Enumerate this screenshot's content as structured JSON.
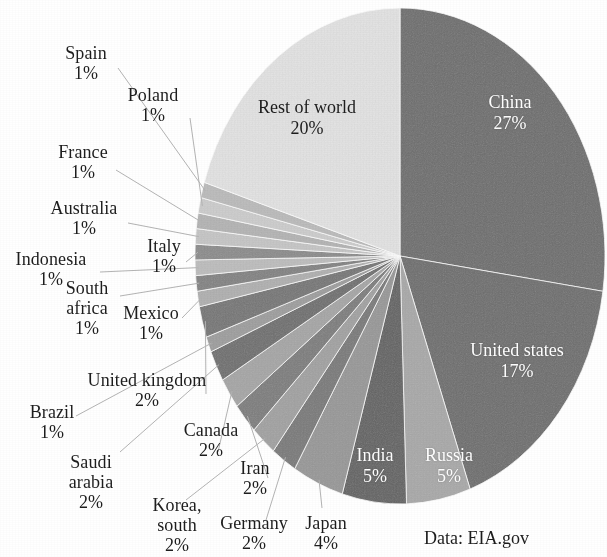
{
  "source_note": "Data: EIA.gov",
  "chart_data": {
    "type": "pie",
    "title": "",
    "subtitle": "",
    "xlabel": "",
    "ylabel": "",
    "legend_position": "none",
    "grid": false,
    "units": "percent",
    "start_angle_deg": 0,
    "direction": "clockwise",
    "annotations": [
      "Data: EIA.gov"
    ],
    "labels": [
      "China",
      "United states",
      "Russia",
      "India",
      "Japan",
      "Germany",
      "Korea, south",
      "Iran",
      "Canada",
      "Saudi arabia",
      "Brazil",
      "United kingdom",
      "Mexico",
      "South africa",
      "Indonesia",
      "Italy",
      "Australia",
      "France",
      "Poland",
      "Spain",
      "Rest of world"
    ],
    "values": [
      27,
      17,
      5,
      5,
      4,
      2,
      2,
      2,
      2,
      2,
      1,
      2,
      1,
      1,
      1,
      1,
      1,
      1,
      1,
      1,
      20
    ],
    "slices": [
      {
        "name": "China",
        "pct": 27,
        "label": "China",
        "pct_label": "27%",
        "color": "#6e6e6e",
        "label_placement": "inside",
        "label_color": "#ffffff"
      },
      {
        "name": "United states",
        "pct": 17,
        "label": "United states",
        "pct_label": "17%",
        "color": "#6e6e6e",
        "label_placement": "inside",
        "label_color": "#ffffff"
      },
      {
        "name": "Russia",
        "pct": 5,
        "label": "Russia",
        "pct_label": "5%",
        "color": "#a9a9a9",
        "label_placement": "inside",
        "label_color": "#ffffff"
      },
      {
        "name": "India",
        "pct": 5,
        "label": "India",
        "pct_label": "5%",
        "color": "#636363",
        "label_placement": "inside",
        "label_color": "#ffffff"
      },
      {
        "name": "Japan",
        "pct": 4,
        "label": "Japan",
        "pct_label": "4%",
        "color": "#989898",
        "label_placement": "outside",
        "label_color": "#1d1d1d"
      },
      {
        "name": "Germany",
        "pct": 2,
        "label": "Germany",
        "pct_label": "2%",
        "color": "#7a7a7a",
        "label_placement": "outside",
        "label_color": "#1d1d1d"
      },
      {
        "name": "Korea, south",
        "pct": 2,
        "label": "Korea,\nsouth",
        "pct_label": "2%",
        "color": "#a2a2a2",
        "label_placement": "outside",
        "label_color": "#1d1d1d"
      },
      {
        "name": "Iran",
        "pct": 2,
        "label": "Iran",
        "pct_label": "2%",
        "color": "#7e7e7e",
        "label_placement": "outside",
        "label_color": "#1d1d1d"
      },
      {
        "name": "Canada",
        "pct": 2,
        "label": "Canada",
        "pct_label": "2%",
        "color": "#a6a6a6",
        "label_placement": "outside",
        "label_color": "#1d1d1d"
      },
      {
        "name": "Saudi arabia",
        "pct": 2,
        "label": "Saudi\narabia",
        "pct_label": "2%",
        "color": "#6f6f6f",
        "label_placement": "outside",
        "label_color": "#1d1d1d"
      },
      {
        "name": "Brazil",
        "pct": 1,
        "label": "Brazil",
        "pct_label": "1%",
        "color": "#9e9e9e",
        "label_placement": "outside",
        "label_color": "#1d1d1d"
      },
      {
        "name": "United kingdom",
        "pct": 2,
        "label": "United kingdom",
        "pct_label": "2%",
        "color": "#767676",
        "label_placement": "outside",
        "label_color": "#1d1d1d"
      },
      {
        "name": "Mexico",
        "pct": 1,
        "label": "Mexico",
        "pct_label": "1%",
        "color": "#b0b0b0",
        "label_placement": "outside",
        "label_color": "#1d1d1d"
      },
      {
        "name": "South africa",
        "pct": 1,
        "label": "South\nafrica",
        "pct_label": "1%",
        "color": "#838383",
        "label_placement": "outside",
        "label_color": "#1d1d1d"
      },
      {
        "name": "Indonesia",
        "pct": 1,
        "label": "Indonesia",
        "pct_label": "1%",
        "color": "#bdbdbd",
        "label_placement": "outside",
        "label_color": "#1d1d1d"
      },
      {
        "name": "Italy",
        "pct": 1,
        "label": "Italy",
        "pct_label": "1%",
        "color": "#8c8c8c",
        "label_placement": "outside",
        "label_color": "#1d1d1d"
      },
      {
        "name": "Australia",
        "pct": 1,
        "label": "Australia",
        "pct_label": "1%",
        "color": "#c6c6c6",
        "label_placement": "outside",
        "label_color": "#1d1d1d"
      },
      {
        "name": "France",
        "pct": 1,
        "label": "France",
        "pct_label": "1%",
        "color": "#b4b4b4",
        "label_placement": "outside",
        "label_color": "#1d1d1d"
      },
      {
        "name": "Poland",
        "pct": 1,
        "label": "Poland",
        "pct_label": "1%",
        "color": "#cdcdcd",
        "label_placement": "outside",
        "label_color": "#1d1d1d"
      },
      {
        "name": "Spain",
        "pct": 1,
        "label": "Spain",
        "pct_label": "1%",
        "color": "#bbbbbb",
        "label_placement": "outside",
        "label_color": "#1d1d1d"
      },
      {
        "name": "Rest of world",
        "pct": 20,
        "label": "Rest of world",
        "pct_label": "20%",
        "color": "#e3e3e3",
        "label_placement": "inside",
        "label_color": "#1d1d1d"
      }
    ]
  },
  "labels": {
    "china": {
      "name": "China",
      "pct": "27%"
    },
    "united_states": {
      "name": "United states",
      "pct": "17%"
    },
    "russia": {
      "name": "Russia",
      "pct": "5%"
    },
    "india": {
      "name": "India",
      "pct": "5%"
    },
    "japan": {
      "name": "Japan",
      "pct": "4%"
    },
    "germany": {
      "name": "Germany",
      "pct": "2%"
    },
    "korea_south_1": {
      "name": "Korea,",
      "name2": "south",
      "pct": "2%"
    },
    "iran": {
      "name": "Iran",
      "pct": "2%"
    },
    "canada": {
      "name": "Canada",
      "pct": "2%"
    },
    "saudi_arabia": {
      "name": "Saudi",
      "name2": "arabia",
      "pct": "2%"
    },
    "brazil": {
      "name": "Brazil",
      "pct": "1%"
    },
    "united_kingdom": {
      "name": "United kingdom",
      "pct": "2%"
    },
    "mexico": {
      "name": "Mexico",
      "pct": "1%"
    },
    "south_africa": {
      "name": "South",
      "name2": "africa",
      "pct": "1%"
    },
    "indonesia": {
      "name": "Indonesia",
      "pct": "1%"
    },
    "italy": {
      "name": "Italy",
      "pct": "1%"
    },
    "australia": {
      "name": "Australia",
      "pct": "1%"
    },
    "france": {
      "name": "France",
      "pct": "1%"
    },
    "poland": {
      "name": "Poland",
      "pct": "1%"
    },
    "spain": {
      "name": "Spain",
      "pct": "1%"
    },
    "rest_of_world": {
      "name": "Rest of world",
      "pct": "20%"
    }
  }
}
